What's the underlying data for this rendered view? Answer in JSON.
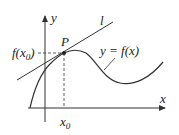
{
  "diagram": {
    "labels": {
      "y_axis": "y",
      "x_axis": "x",
      "line": "l",
      "point": "P",
      "curve": "y = f(x)",
      "fx0_main": "f(x",
      "fx0_sub": "0",
      "fx0_close": ")",
      "x0_main": "x",
      "x0_sub": "0"
    },
    "colors": {
      "stroke": "#333333",
      "text": "#222222",
      "background": "#ffffff"
    }
  }
}
